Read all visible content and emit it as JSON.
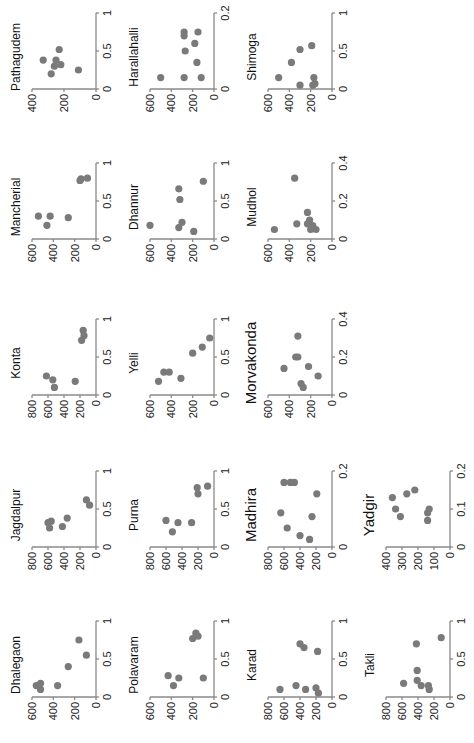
{
  "figure": {
    "orientation": "rotated 90 degrees counter-clockwise",
    "panel_count": 17
  },
  "chart_data": [
    {
      "type": "scatter",
      "title": "Dhalegaon",
      "xlim": [
        0,
        1
      ],
      "xticks": [
        "0",
        "0.5",
        "1"
      ],
      "ylim": [
        0,
        600
      ],
      "yticks": [
        "0",
        "200",
        "400",
        "600"
      ],
      "points": [
        [
          0.1,
          520
        ],
        [
          0.15,
          560
        ],
        [
          0.18,
          520
        ],
        [
          0.15,
          360
        ],
        [
          0.4,
          260
        ],
        [
          0.55,
          90
        ],
        [
          0.75,
          160
        ]
      ]
    },
    {
      "type": "scatter",
      "title": "Jagdalpur",
      "xlim": [
        0,
        1
      ],
      "xticks": [
        "0",
        "0.5",
        "1"
      ],
      "ylim": [
        0,
        800
      ],
      "yticks": [
        "0",
        "200",
        "400",
        "600",
        "800"
      ],
      "points": [
        [
          0.25,
          580
        ],
        [
          0.32,
          600
        ],
        [
          0.34,
          560
        ],
        [
          0.27,
          420
        ],
        [
          0.38,
          360
        ],
        [
          0.55,
          80
        ],
        [
          0.62,
          120
        ]
      ]
    },
    {
      "type": "scatter",
      "title": "Konta",
      "xlim": [
        0,
        1
      ],
      "xticks": [
        "0",
        "0.5",
        "1"
      ],
      "ylim": [
        0,
        800
      ],
      "yticks": [
        "0",
        "200",
        "400",
        "600",
        "800"
      ],
      "points": [
        [
          0.1,
          520
        ],
        [
          0.2,
          540
        ],
        [
          0.25,
          620
        ],
        [
          0.18,
          260
        ],
        [
          0.72,
          180
        ],
        [
          0.78,
          150
        ],
        [
          0.85,
          160
        ]
      ]
    },
    {
      "type": "scatter",
      "title": "Mancherial",
      "xlim": [
        0,
        1
      ],
      "xticks": [
        "0",
        "0.5",
        "1"
      ],
      "ylim": [
        0,
        600
      ],
      "yticks": [
        "0",
        "200",
        "400",
        "600"
      ],
      "points": [
        [
          0.18,
          460
        ],
        [
          0.3,
          540
        ],
        [
          0.3,
          430
        ],
        [
          0.28,
          260
        ],
        [
          0.77,
          150
        ],
        [
          0.79,
          140
        ],
        [
          0.8,
          80
        ]
      ]
    },
    {
      "type": "scatter",
      "title": "Pathagudem",
      "xlim": [
        0,
        1
      ],
      "xticks": [
        "0",
        "0.5",
        "1"
      ],
      "ylim": [
        0,
        400
      ],
      "yticks": [
        "0",
        "200",
        "400"
      ],
      "points": [
        [
          0.2,
          280
        ],
        [
          0.3,
          260
        ],
        [
          0.38,
          330
        ],
        [
          0.38,
          250
        ],
        [
          0.32,
          220
        ],
        [
          0.25,
          110
        ],
        [
          0.52,
          230
        ]
      ]
    },
    {
      "type": "scatter",
      "title": "Polavaram",
      "xlim": [
        0,
        1
      ],
      "xticks": [
        "0",
        "0.5",
        "1"
      ],
      "ylim": [
        0,
        600
      ],
      "yticks": [
        "0",
        "200",
        "400",
        "600"
      ],
      "points": [
        [
          0.15,
          380
        ],
        [
          0.28,
          430
        ],
        [
          0.25,
          330
        ],
        [
          0.25,
          100
        ],
        [
          0.77,
          200
        ],
        [
          0.8,
          150
        ],
        [
          0.84,
          170
        ]
      ]
    },
    {
      "type": "scatter",
      "title": "Purna",
      "xlim": [
        0,
        1
      ],
      "xticks": [
        "0",
        "0.5",
        "1"
      ],
      "ylim": [
        0,
        800
      ],
      "yticks": [
        "0",
        "200",
        "400",
        "600",
        "800"
      ],
      "points": [
        [
          0.2,
          520
        ],
        [
          0.35,
          600
        ],
        [
          0.32,
          450
        ],
        [
          0.32,
          280
        ],
        [
          0.7,
          200
        ],
        [
          0.78,
          210
        ],
        [
          0.8,
          80
        ]
      ]
    },
    {
      "type": "scatter",
      "title": "Yelli",
      "xlim": [
        0,
        1
      ],
      "xticks": [
        "0",
        "0.5",
        "1"
      ],
      "ylim": [
        0,
        600
      ],
      "yticks": [
        "0",
        "200",
        "400",
        "600"
      ],
      "points": [
        [
          0.18,
          520
        ],
        [
          0.3,
          470
        ],
        [
          0.3,
          420
        ],
        [
          0.22,
          310
        ],
        [
          0.55,
          200
        ],
        [
          0.63,
          110
        ],
        [
          0.75,
          40
        ]
      ]
    },
    {
      "type": "scatter",
      "title": "Dhannur",
      "xlim": [
        0,
        1
      ],
      "xticks": [
        "0",
        "0.5",
        "1"
      ],
      "ylim": [
        0,
        600
      ],
      "yticks": [
        "0",
        "200",
        "400",
        "600"
      ],
      "points": [
        [
          0.18,
          600
        ],
        [
          0.15,
          330
        ],
        [
          0.22,
          300
        ],
        [
          0.1,
          190
        ],
        [
          0.52,
          320
        ],
        [
          0.66,
          330
        ],
        [
          0.76,
          100
        ]
      ]
    },
    {
      "type": "scatter",
      "title": "Harallahalli",
      "xlim": [
        0,
        0.2
      ],
      "xticks": [
        "0",
        "0.2"
      ],
      "ylim": [
        0,
        600
      ],
      "yticks": [
        "0",
        "200",
        "400",
        "600"
      ],
      "points": [
        [
          0.03,
          500
        ],
        [
          0.03,
          280
        ],
        [
          0.03,
          120
        ],
        [
          0.07,
          160
        ],
        [
          0.1,
          270
        ],
        [
          0.12,
          180
        ],
        [
          0.15,
          280
        ],
        [
          0.15,
          150
        ],
        [
          0.14,
          280
        ]
      ]
    },
    {
      "type": "scatter",
      "title": "Karad",
      "xlim": [
        0,
        1
      ],
      "xticks": [
        "0",
        "0.5",
        "1"
      ],
      "ylim": [
        0,
        800
      ],
      "yticks": [
        "0",
        "200",
        "400",
        "600",
        "800"
      ],
      "points": [
        [
          0.1,
          650
        ],
        [
          0.15,
          450
        ],
        [
          0.1,
          330
        ],
        [
          0.12,
          200
        ],
        [
          0.05,
          170
        ],
        [
          0.6,
          180
        ],
        [
          0.65,
          350
        ],
        [
          0.7,
          400
        ]
      ]
    },
    {
      "type": "scatter",
      "title": "Madhira",
      "xlim": [
        0,
        0.2
      ],
      "xticks": [
        "0",
        "0.2"
      ],
      "ylim": [
        0,
        800
      ],
      "yticks": [
        "0",
        "200",
        "400",
        "600",
        "800"
      ],
      "points": [
        [
          0.03,
          400
        ],
        [
          0.05,
          560
        ],
        [
          0.09,
          640
        ],
        [
          0.17,
          600
        ],
        [
          0.17,
          520
        ],
        [
          0.17,
          470
        ],
        [
          0.08,
          250
        ],
        [
          0.14,
          190
        ],
        [
          0.02,
          280
        ]
      ]
    },
    {
      "type": "scatter",
      "title": "Morvakonda",
      "xlim": [
        0,
        0.4
      ],
      "xticks": [
        "0",
        "0.2",
        "0.4"
      ],
      "ylim": [
        0,
        600
      ],
      "yticks": [
        "0",
        "200",
        "400",
        "600"
      ],
      "points": [
        [
          0.06,
          290
        ],
        [
          0.04,
          270
        ],
        [
          0.1,
          130
        ],
        [
          0.15,
          220
        ],
        [
          0.2,
          320
        ],
        [
          0.2,
          340
        ],
        [
          0.14,
          450
        ],
        [
          0.31,
          320
        ]
      ]
    },
    {
      "type": "scatter",
      "title": "Mudhol",
      "xlim": [
        0,
        0.4
      ],
      "xticks": [
        "0",
        "0.2",
        "0.4"
      ],
      "ylim": [
        0,
        600
      ],
      "yticks": [
        "0",
        "200",
        "400",
        "600"
      ],
      "points": [
        [
          0.05,
          540
        ],
        [
          0.08,
          330
        ],
        [
          0.08,
          230
        ],
        [
          0.07,
          180
        ],
        [
          0.05,
          150
        ],
        [
          0.05,
          200
        ],
        [
          0.14,
          230
        ],
        [
          0.1,
          210
        ],
        [
          0.32,
          350
        ]
      ]
    },
    {
      "type": "scatter",
      "title": "Shimoga",
      "xlim": [
        0,
        1
      ],
      "xticks": [
        "0",
        "0.5",
        "1"
      ],
      "ylim": [
        0,
        600
      ],
      "yticks": [
        "0",
        "200",
        "400",
        "600"
      ],
      "points": [
        [
          0.15,
          500
        ],
        [
          0.35,
          380
        ],
        [
          0.52,
          300
        ],
        [
          0.57,
          190
        ],
        [
          0.05,
          300
        ],
        [
          0.05,
          180
        ],
        [
          0.07,
          160
        ],
        [
          0.15,
          170
        ]
      ]
    },
    {
      "type": "scatter",
      "title": "Takli",
      "xlim": [
        0,
        1
      ],
      "xticks": [
        "0",
        "0.5",
        "1"
      ],
      "ylim": [
        0,
        800
      ],
      "yticks": [
        "0",
        "200",
        "400",
        "600",
        "800"
      ],
      "points": [
        [
          0.18,
          580
        ],
        [
          0.35,
          410
        ],
        [
          0.22,
          410
        ],
        [
          0.15,
          360
        ],
        [
          0.15,
          270
        ],
        [
          0.1,
          260
        ],
        [
          0.7,
          420
        ],
        [
          0.78,
          110
        ]
      ]
    },
    {
      "type": "scatter",
      "title": "Yadgir",
      "xlim": [
        0,
        0.2
      ],
      "xticks": [
        "0",
        "0.1",
        "0.2"
      ],
      "ylim": [
        0,
        400
      ],
      "yticks": [
        "0",
        "100",
        "200",
        "300",
        "400"
      ],
      "points": [
        [
          0.13,
          360
        ],
        [
          0.1,
          340
        ],
        [
          0.08,
          310
        ],
        [
          0.14,
          270
        ],
        [
          0.15,
          220
        ],
        [
          0.07,
          140
        ],
        [
          0.09,
          140
        ],
        [
          0.1,
          130
        ]
      ]
    }
  ],
  "style": {
    "dot_color": "#7a7a7a",
    "axis_color": "#8a8a8a",
    "background": "#ffffff"
  }
}
